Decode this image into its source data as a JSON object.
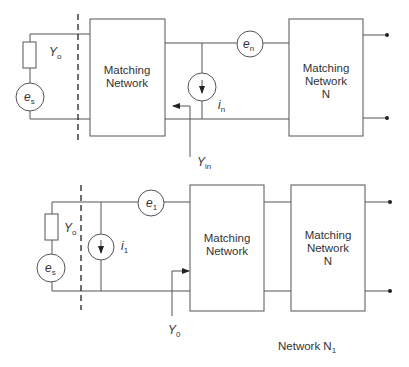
{
  "diagram": {
    "top": {
      "source_admittance": {
        "sym": "Y",
        "sub": "o"
      },
      "source_voltage": {
        "sym": "e",
        "sub": "s"
      },
      "matching_network_1": {
        "line1": "Matching",
        "line2": "Network"
      },
      "noise_voltage": {
        "sym": "e",
        "sub": "n"
      },
      "noise_current": {
        "sym": "i",
        "sub": "n"
      },
      "input_admittance": {
        "sym": "Y",
        "sub": "in"
      },
      "matching_network_n": {
        "line1": "Matching",
        "line2": "Network",
        "line3": "N"
      }
    },
    "bottom": {
      "source_admittance": {
        "sym": "Y",
        "sub": "o"
      },
      "source_voltage": {
        "sym": "e",
        "sub": "s"
      },
      "noise_current": {
        "sym": "i",
        "sub": "1"
      },
      "noise_voltage": {
        "sym": "e",
        "sub": "1"
      },
      "reference_admittance": {
        "sym": "Y",
        "sub": "0"
      },
      "matching_network_1": {
        "line1": "Matching",
        "line2": "Network"
      },
      "matching_network_n": {
        "line1": "Matching",
        "line2": "Network",
        "line3": "N"
      },
      "caption": {
        "text": "Network N",
        "sub": "1"
      }
    }
  }
}
